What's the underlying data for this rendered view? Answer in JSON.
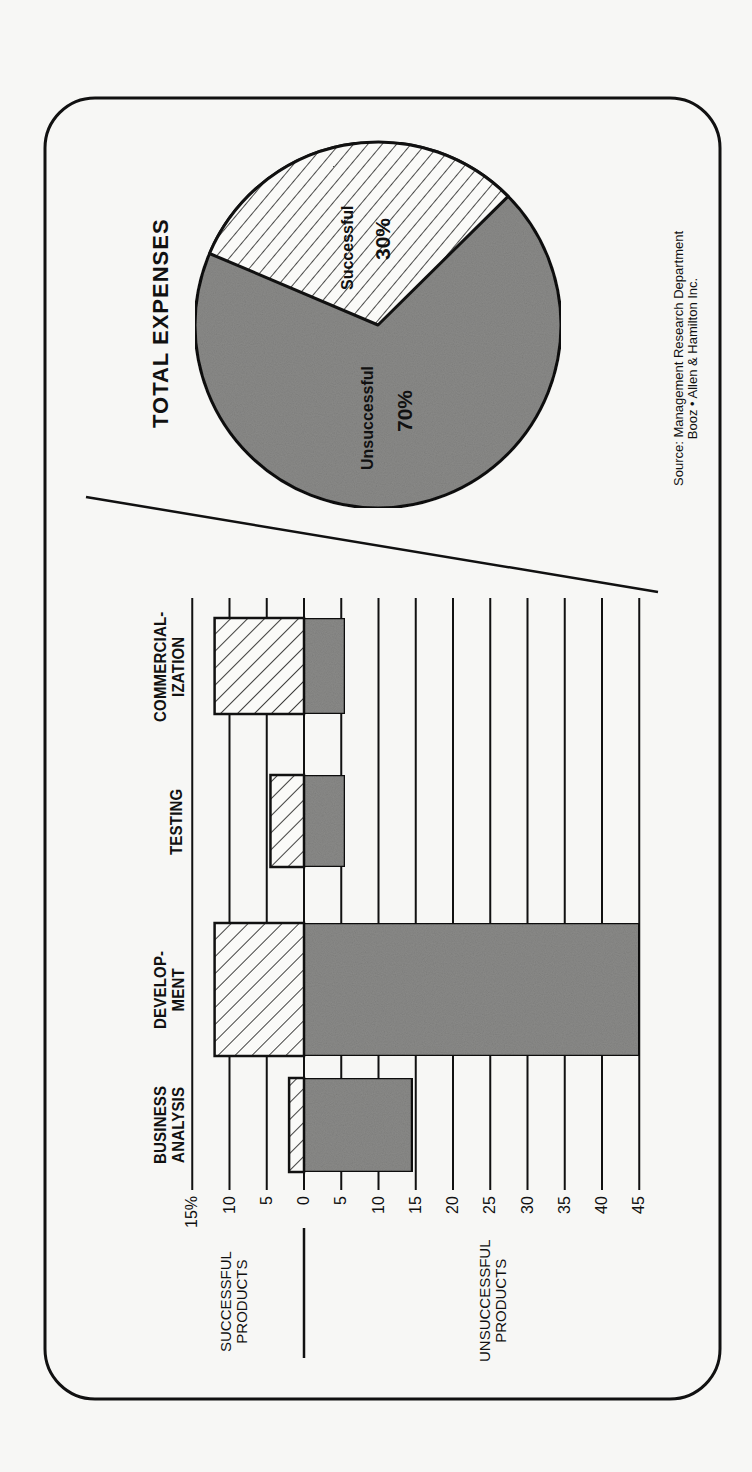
{
  "chart_data": [
    {
      "type": "bar",
      "orientation": "diverging (rotated 90° counter-clockwise in image)",
      "title": "",
      "categories": [
        "BUSINESS ANALYSIS",
        "DEVELOPMENT",
        "TESTING",
        "COMMERCIALIZATION"
      ],
      "category_labels": [
        [
          "BUSINESS",
          "ANALYSIS"
        ],
        [
          "DEVELOP-",
          "MENT"
        ],
        [
          "TESTING"
        ],
        [
          "COMMERCIAL-",
          "IZATION"
        ]
      ],
      "series": [
        {
          "name": "SUCCESSFUL PRODUCTS",
          "pattern": "diagonal-hatch",
          "values": [
            2,
            12,
            4.5,
            12
          ]
        },
        {
          "name": "UNSUCCESSFUL PRODUCTS",
          "pattern": "gray-fill",
          "values": [
            14.5,
            45,
            5.5,
            5.5
          ]
        }
      ],
      "axis": {
        "successful_side_label": [
          "SUCCESSFUL",
          "PRODUCTS"
        ],
        "unsuccessful_side_label": [
          "UNSUCCESSFUL",
          "PRODUCTS"
        ],
        "successful_ticks": [
          "15%",
          "10",
          "5"
        ],
        "zero_tick": "0",
        "unsuccessful_ticks": [
          "5",
          "10",
          "15",
          "20",
          "25",
          "30",
          "35",
          "40",
          "45"
        ],
        "range_successful": [
          0,
          15
        ],
        "range_unsuccessful": [
          0,
          45
        ],
        "unit": "% of expenses"
      },
      "grid": true,
      "legend": "none (side labels on value axis)"
    },
    {
      "type": "pie",
      "title": "TOTAL EXPENSES",
      "slices": [
        {
          "label": "Successful",
          "value": 30,
          "display": "30%",
          "pattern": "diagonal-hatch"
        },
        {
          "label": "Unsuccessful",
          "value": 70,
          "display": "70%",
          "pattern": "gray-fill"
        }
      ]
    }
  ],
  "source": {
    "line1": "Source: Management Research Department",
    "line2": "Booz • Allen & Hamilton Inc."
  },
  "colors": {
    "ink": "#111111",
    "paper": "#f7f7f5",
    "gray_fill": "#8a8a88",
    "hatch_bg": "#fafaf8"
  }
}
